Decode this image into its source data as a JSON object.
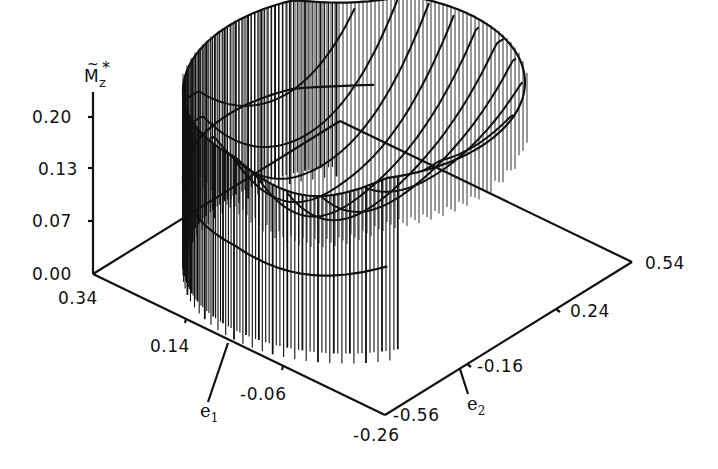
{
  "chart_data": {
    "type": "surface3d",
    "title": "",
    "zlabel": "M̃z*",
    "zlabel_parts": {
      "base": "M",
      "tilde": "~",
      "sub": "z",
      "sup": "*"
    },
    "xlabel": "e1",
    "xlabel_parts": {
      "base": "e",
      "sub": "1"
    },
    "ylabel": "e2",
    "ylabel_parts": {
      "base": "e",
      "sub": "2"
    },
    "z_ticks": [
      "0.20",
      "0.13",
      "0.07",
      "0.00"
    ],
    "z_tick_values": [
      0.2,
      0.13,
      0.07,
      0.0
    ],
    "e1_ticks": [
      "0.34",
      "0.14",
      "-0.06",
      "-0.26"
    ],
    "e1_tick_values": [
      0.34,
      0.14,
      -0.06,
      -0.26
    ],
    "e2_ticks": [
      "-0.56",
      "-0.16",
      "0.24",
      "0.54"
    ],
    "e2_tick_values": [
      -0.56,
      -0.16,
      0.24,
      0.54
    ],
    "e1_range": [
      -0.26,
      0.34
    ],
    "e2_range": [
      -0.56,
      0.54
    ],
    "z_range": [
      0.0,
      0.2
    ],
    "domain": "elliptical region in (e1, e2) plane",
    "surface_description": "Saddle/trough-shaped surface over an elliptical base; max ≈0.20 along the back rim, dipping toward ≈0.07 in the central trough; rendered with vertical hatching and diagonal grid lines",
    "grid": false,
    "legend": null
  },
  "labels": {
    "z": [
      "0.20",
      "0.13",
      "0.07",
      "0.00"
    ],
    "e1": [
      "0.34",
      "0.14",
      "-0.06",
      "-0.26"
    ],
    "e2": [
      "-0.56",
      "-0.16",
      "0.24",
      "0.54"
    ],
    "e1_name": "e",
    "e1_sub": "1",
    "e2_name": "e",
    "e2_sub": "2",
    "mz_base": "M",
    "mz_tilde": "~",
    "mz_sub": "z",
    "mz_star": "*"
  },
  "colors": {
    "ink": "#111111",
    "background": "#ffffff"
  }
}
